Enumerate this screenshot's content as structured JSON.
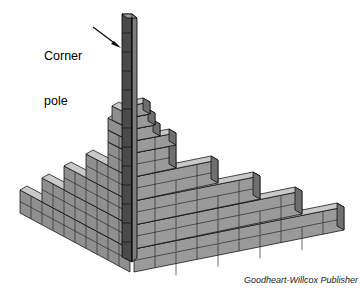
{
  "figure": {
    "view": "isometric",
    "background_color": "#ffffff"
  },
  "annotations": {
    "corner_pole": {
      "line1": "Corner",
      "line2": "pole",
      "leader": "arrow-pointing-right-to-pole"
    }
  },
  "credit": {
    "text": "Goodheart-Willcox Publisher"
  },
  "colors": {
    "brick_face": "#8f8f8f",
    "brick_face_right": "#9a9a9a",
    "brick_top": "#c9c9c9",
    "brick_end": "#6f6f6f",
    "mortar": "#2b2b2b",
    "outline": "#000000",
    "pole_front": "#4a4a4a",
    "pole_side": "#7d7d7d",
    "label_text": "#000000",
    "credit_text": "#1a1a1a"
  },
  "structure": {
    "courses": 9,
    "left_wall_steps": 9,
    "right_wall_steps": 9,
    "bond": "running bond",
    "pole_course_marks": 13
  }
}
